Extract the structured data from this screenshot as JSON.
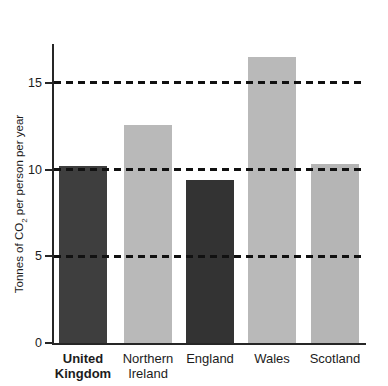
{
  "chart_data": {
    "type": "bar",
    "title": "",
    "ylabel_prefix": "Tonnes of CO",
    "ylabel_sub": "2",
    "ylabel_suffix": " per person per year",
    "xlabel": "",
    "ylim": [
      0,
      17.2
    ],
    "yticks": [
      0,
      5,
      10,
      15
    ],
    "gridlines": [
      5,
      10,
      15
    ],
    "grid_style": "dashed",
    "legend": "none",
    "axis_color": "#262626",
    "gridline_color": "#111111",
    "categories": [
      {
        "label_line1": "United",
        "label_line2": "Kingdom",
        "bold": true,
        "value": 10.2,
        "color": "#3e3e3e",
        "textured": false
      },
      {
        "label_line1": "Northern",
        "label_line2": "Ireland",
        "bold": false,
        "value": 12.6,
        "color": "#b9b9b9",
        "textured": false
      },
      {
        "label_line1": "England",
        "label_line2": "",
        "bold": false,
        "value": 9.4,
        "color": "#333333",
        "textured": false
      },
      {
        "label_line1": "Wales",
        "label_line2": "",
        "bold": false,
        "value": 16.5,
        "color": "#b9b9b9",
        "textured": false
      },
      {
        "label_line1": "Scotland",
        "label_line2": "",
        "bold": false,
        "value": 10.3,
        "color": "#b5b5b5",
        "textured": true
      }
    ]
  }
}
